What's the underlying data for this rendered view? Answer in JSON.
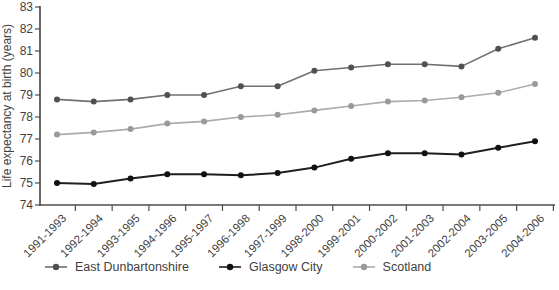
{
  "figure": {
    "background": "#ffffff",
    "axis_color": "#4d4d4d",
    "text_color": "#3f3f3f"
  },
  "chart_data": {
    "type": "line",
    "title": "",
    "xlabel": "",
    "ylabel": "Life expectancy at birth (years)",
    "ylim": [
      74,
      83
    ],
    "yticks": [
      83,
      82,
      81,
      80,
      79,
      78,
      77,
      76,
      75,
      74
    ],
    "grid": false,
    "legend_position": "bottom",
    "categories": [
      "1991-1993",
      "1992-1994",
      "1993-1995",
      "1994-1996",
      "1995-1997",
      "1996-1998",
      "1997-1999",
      "1998-2000",
      "1999-2001",
      "2000-2002",
      "2001-2003",
      "2002-2004",
      "2003-2005",
      "2004-2006"
    ],
    "series": [
      {
        "name": "East Dunbartonshire",
        "line_color": "#707070",
        "marker_color": "#505050",
        "line_width": 1.6,
        "values": [
          78.8,
          78.7,
          78.8,
          79.0,
          79.0,
          79.4,
          79.4,
          80.1,
          80.25,
          80.4,
          80.4,
          80.3,
          81.1,
          81.6
        ]
      },
      {
        "name": "Glasgow City",
        "line_color": "#1f1f1f",
        "marker_color": "#111111",
        "line_width": 2,
        "values": [
          75.0,
          74.95,
          75.2,
          75.4,
          75.4,
          75.35,
          75.45,
          75.7,
          76.1,
          76.35,
          76.35,
          76.3,
          76.6,
          76.9
        ]
      },
      {
        "name": "Scotland",
        "line_color": "#ababab",
        "marker_color": "#9a9a9a",
        "line_width": 1.6,
        "values": [
          77.2,
          77.3,
          77.45,
          77.7,
          77.8,
          78.0,
          78.1,
          78.3,
          78.5,
          78.7,
          78.75,
          78.9,
          79.1,
          79.5
        ]
      }
    ]
  }
}
